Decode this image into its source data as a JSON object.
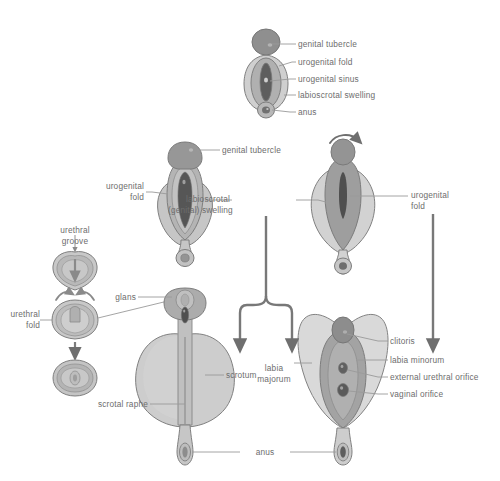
{
  "figure": {
    "type": "anatomical-developmental-diagram",
    "palette": {
      "outline": "#7d7d7d",
      "label_text": "#6d6d6d",
      "leader_line": "#9a9a9a",
      "arrow": "#6f6f6f",
      "tubercle_fill": "#8e8e8e",
      "fold_fill": "#a8a8a8",
      "swelling_fill": "#c9c9c9",
      "sinus_fill": "#5f5f5f",
      "pale_fill": "#d8d8d8",
      "mid_fill": "#b5b5b5",
      "dark_fill": "#555555",
      "background": "#ffffff"
    }
  },
  "panels": {
    "indifferent": {
      "name": "indifferent-stage",
      "labels": [
        {
          "id": "genital-tubercle",
          "text": "genital tubercle"
        },
        {
          "id": "urogenital-fold",
          "text": "urogenital fold"
        },
        {
          "id": "urogenital-sinus",
          "text": "urogenital sinus"
        },
        {
          "id": "labioscrotal-swelling",
          "text": "labioscrotal swelling"
        },
        {
          "id": "anus",
          "text": "anus"
        }
      ]
    },
    "male_pathway": {
      "name": "male-differentiation-stage",
      "labels": [
        {
          "id": "genital-tubercle",
          "text": "genital tubercle"
        },
        {
          "id": "urogenital-fold",
          "text": "urogenital\nfold"
        },
        {
          "id": "labioscrotal-swelling",
          "text": "labioscrotal\n(genital) swelling"
        }
      ]
    },
    "female_pathway": {
      "name": "female-differentiation-stage",
      "labels": [
        {
          "id": "urogenital-fold",
          "text": "urogenital\nfold"
        }
      ]
    },
    "cross_sections": {
      "name": "urethral-fold-cross-sections",
      "labels": [
        {
          "id": "urethral-groove",
          "text": "urethral\ngroove"
        },
        {
          "id": "urethral-fold",
          "text": "urethral\nfold"
        }
      ]
    },
    "male_mature": {
      "name": "male-mature-genitalia",
      "labels": [
        {
          "id": "glans",
          "text": "glans"
        },
        {
          "id": "scrotum",
          "text": "scrotum"
        },
        {
          "id": "scrotal-raphe",
          "text": "scrotal raphe"
        }
      ]
    },
    "female_mature": {
      "name": "female-mature-genitalia",
      "labels": [
        {
          "id": "clitoris",
          "text": "clitoris"
        },
        {
          "id": "labia-minorum",
          "text": "labia minorum"
        },
        {
          "id": "external-urethral-orifice",
          "text": "external urethral orifice"
        },
        {
          "id": "vaginal-orifice",
          "text": "vaginal orifice"
        },
        {
          "id": "labia-majorum",
          "text": "labia\nmajorum"
        }
      ]
    },
    "shared": {
      "name": "shared-structures",
      "labels": [
        {
          "id": "anus",
          "text": "anus"
        }
      ]
    }
  },
  "text": {
    "genital_tubercle_top": "genital tubercle",
    "urogenital_fold_top": "urogenital fold",
    "urogenital_sinus_top": "urogenital sinus",
    "labioscrotal_swelling_top": "labioscrotal swelling",
    "anus_top": "anus",
    "genital_tubercle_mid": "genital tubercle",
    "urogenital_fold_left": "urogenital\nfold",
    "labioscrotal_genital_swelling": "labioscrotal\n(genital) swelling",
    "urogenital_fold_right": "urogenital\nfold",
    "urethral_groove": "urethral\ngroove",
    "urethral_fold": "urethral\nfold",
    "glans": "glans",
    "scrotum": "scrotum",
    "scrotal_raphe": "scrotal raphe",
    "labia_majorum": "labia\nmajorum",
    "clitoris": "clitoris",
    "labia_minorum": "labia minorum",
    "external_urethral_orifice": "external urethral orifice",
    "vaginal_orifice": "vaginal orifice",
    "anus_bottom": "anus"
  }
}
